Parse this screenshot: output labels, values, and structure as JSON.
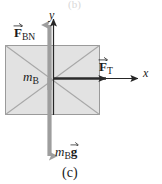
{
  "figure": {
    "caption": "(c)",
    "axes": {
      "y_label": "y",
      "x_label": "x",
      "origin": {
        "x": 53,
        "y": 78
      },
      "y_axis_top": 16,
      "x_axis_right": 140
    },
    "block": {
      "name": "block-B",
      "fill_color": "#e2e2e2",
      "stroke_color": "#9a9a9a",
      "diagonal_color": "#a8a8a8",
      "left": 5,
      "top": 45,
      "width": 95,
      "height": 70
    },
    "vectors": [
      {
        "id": "F_BN",
        "label_symbol": "F",
        "label_subscript": "BN",
        "has_vector_arrow": true,
        "direction": "up",
        "color": "#9e9e9e",
        "description": "normal force on block B from surface"
      },
      {
        "id": "F_T",
        "label_symbol": "F",
        "label_subscript": "T",
        "has_vector_arrow": true,
        "direction": "right",
        "color": "#2b2b2b",
        "description": "tension force on block B"
      },
      {
        "id": "m_B_g",
        "label_mass_symbol": "m",
        "label_mass_subscript": "B",
        "label_symbol": "g",
        "has_vector_arrow": true,
        "direction": "down",
        "color": "#9e9e9e",
        "description": "weight of block B"
      }
    ],
    "mass_label": {
      "symbol": "m",
      "subscript": "B"
    },
    "colors": {
      "background": "#ffffff",
      "axis": "#262626",
      "gray_arrow": "#9e9e9e",
      "dark_arrow": "#2b2b2b",
      "block_fill": "#e2e2e2",
      "block_stroke": "#9a9a9a",
      "text": "#1a1a1a"
    },
    "top_ghost_text": "(b)"
  }
}
